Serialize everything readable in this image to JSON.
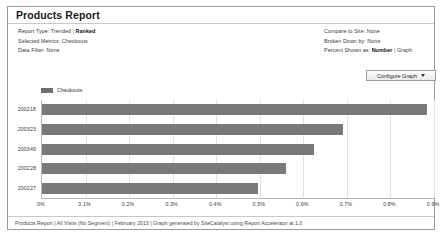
{
  "report": {
    "title": "Products Report",
    "meta_left": [
      {
        "label": "Report Type:",
        "value": "Trended",
        "separator": "|",
        "value2": "Ranked",
        "value2_bold": true
      },
      {
        "label": "Selected Metrics:",
        "value": "Checkouts"
      },
      {
        "label": "Data Filter:",
        "value": "None"
      }
    ],
    "meta_right": [
      {
        "label": "Compare to Site:",
        "value": "None"
      },
      {
        "label": "Broken Down by:",
        "value": "None"
      },
      {
        "label": "Percent Shown as:",
        "value": "Number",
        "separator": "|",
        "value2": "Graph",
        "value_bold": true
      }
    ],
    "configure_button": {
      "label": "Configure Graph",
      "caret_icon": "chevron-down-icon"
    },
    "footer": "Products Report | All Visits (No Segment) | February 2013 | Graph generated by SiteCatalyst using Report Accelerator at 1.0"
  },
  "colors": {
    "bar": "#797979",
    "legend_swatch": "#6f6f6f",
    "panel_border": "#9a9a9a",
    "gridline": "#e2e2e2",
    "axis": "#b9b9b9"
  },
  "chart_data": {
    "type": "bar",
    "orientation": "horizontal",
    "title": "",
    "xlabel": "",
    "ylabel": "",
    "categories": [
      "200218",
      "200323",
      "200349",
      "200228",
      "200227"
    ],
    "values": [
      0.885,
      0.69,
      0.625,
      0.56,
      0.495
    ],
    "value_suffix": "%",
    "xlim": [
      0,
      0.9
    ],
    "xticks": [
      0,
      0.1,
      0.2,
      0.3,
      0.4,
      0.5,
      0.6,
      0.7,
      0.8,
      0.9
    ],
    "xticklabels": [
      "0%",
      "0.1%",
      "0.2%",
      "0.3%",
      "0.4%",
      "0.5%",
      "0.6%",
      "0.7%",
      "0.8%",
      "0.9%"
    ],
    "legend": [
      "Checkouts"
    ],
    "legend_position": "top-left",
    "grid": true,
    "series": [
      {
        "name": "Checkouts",
        "values": [
          0.885,
          0.69,
          0.625,
          0.56,
          0.495
        ]
      }
    ]
  }
}
